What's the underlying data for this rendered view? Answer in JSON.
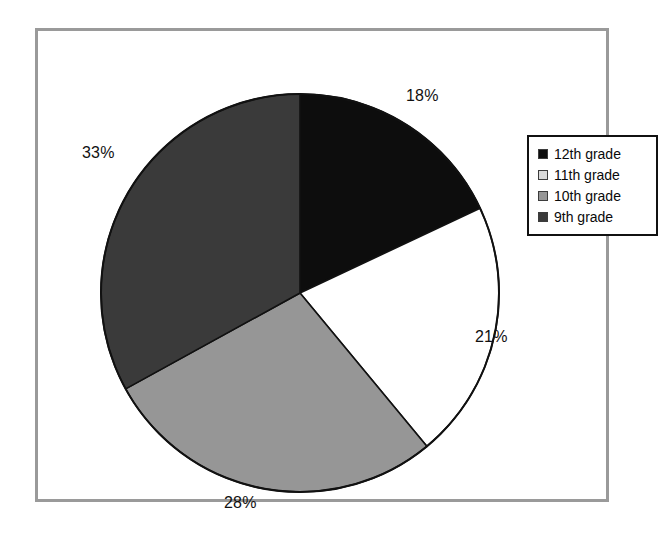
{
  "chart_data": {
    "type": "pie",
    "title": "",
    "subtitle": "",
    "xlabel": "",
    "ylabel": "",
    "grid": false,
    "legend_position": "right",
    "start_angle_deg": 0,
    "direction": "clockwise",
    "categories": [
      "12th grade",
      "11th grade",
      "10th grade",
      "9th grade"
    ],
    "values": [
      18,
      21,
      28,
      33
    ],
    "value_unit": "%",
    "data_labels": [
      "18%",
      "21%",
      "28%",
      "33%"
    ],
    "colors": [
      "#0d0d0d",
      "#ffffff",
      "#969696",
      "#3a3a3a"
    ],
    "slices": [
      {
        "label": "12th grade",
        "value": 18,
        "data_label": "18%",
        "color": "#0d0d0d"
      },
      {
        "label": "11th grade",
        "value": 21,
        "data_label": "21%",
        "color": "#ffffff"
      },
      {
        "label": "10th grade",
        "value": 28,
        "data_label": "28%",
        "color": "#969696"
      },
      {
        "label": "9th grade",
        "value": 33,
        "data_label": "33%",
        "color": "#3a3a3a"
      }
    ]
  },
  "labels": {
    "pct_12th": "18%",
    "pct_11th": "21%",
    "pct_10th": "28%",
    "pct_9th": "33%"
  },
  "legend": {
    "items": [
      {
        "label": "12th grade",
        "color": "#0d0d0d"
      },
      {
        "label": "11th grade",
        "color": "#d9d9d9"
      },
      {
        "label": "10th grade",
        "color": "#969696"
      },
      {
        "label": "9th grade",
        "color": "#3a3a3a"
      }
    ]
  },
  "style": {
    "frame_color": "#9a9a9a",
    "outline_color": "#111111",
    "background": "#ffffff"
  }
}
